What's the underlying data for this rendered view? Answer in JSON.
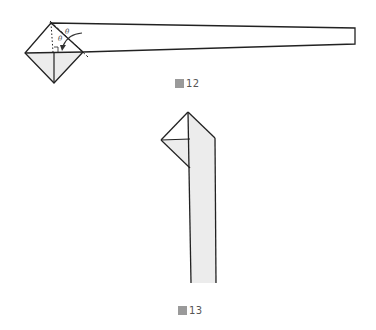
{
  "figures": [
    {
      "id": "fig12",
      "caption_prefix": "圖",
      "caption_number": "12",
      "angle_label": "θ",
      "description": "Folded strip with diamond at left end; arrow indicating fold along dashed line, two equal angles marked θ, right angle mark"
    },
    {
      "id": "fig13",
      "caption_prefix": "圖",
      "caption_number": "13",
      "description": "Vertical strip with triangular fold at top"
    }
  ],
  "colors": {
    "line": "#222222",
    "shade": "#e8e8e8",
    "caption": "#555555"
  }
}
